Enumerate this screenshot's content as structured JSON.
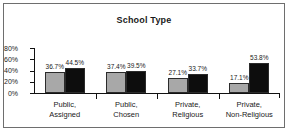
{
  "chart_data": {
    "type": "bar",
    "title": "School Type",
    "xlabel": "",
    "ylabel": "",
    "ylim": [
      0,
      80
    ],
    "yticks": [
      "0%",
      "20%",
      "40%",
      "60%",
      "80%"
    ],
    "grid": false,
    "legend": "none",
    "categories": [
      {
        "line1": "Public,",
        "line2": "Assigned"
      },
      {
        "line1": "Public,",
        "line2": "Chosen"
      },
      {
        "line1": "Private,",
        "line2": "Religious"
      },
      {
        "line1": "Private,",
        "line2": "Non-Religious"
      }
    ],
    "series": [
      {
        "name": "series-a",
        "color": "#a8a8a8",
        "values": [
          36.7,
          37.4,
          27.1,
          17.1
        ],
        "labels": [
          "36.7%",
          "37.4%",
          "27.1%",
          "17.1%"
        ]
      },
      {
        "name": "series-b",
        "color": "#0d0d0d",
        "values": [
          44.5,
          39.5,
          33.7,
          53.8
        ],
        "labels": [
          "44.5%",
          "39.5%",
          "33.7%",
          "53.8%"
        ]
      }
    ]
  }
}
